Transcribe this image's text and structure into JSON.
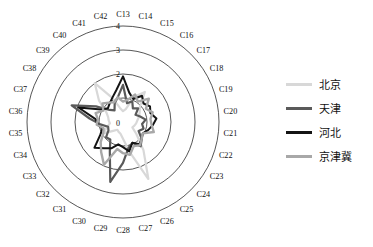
{
  "chart_data": {
    "type": "line",
    "variant": "radar",
    "title": "",
    "xlabel": "",
    "ylabel": "",
    "rlim": [
      0,
      4
    ],
    "r_ticks": [
      0,
      1,
      2,
      3,
      4
    ],
    "r_tick_labels": [
      "0",
      "1",
      "2",
      "3",
      "4"
    ],
    "r_tick_labels_shown": [
      "0",
      "2",
      "3",
      "4"
    ],
    "grid": true,
    "grid_shape": "circular",
    "legend_position": "right",
    "start_angle_deg": 90,
    "direction": "clockwise",
    "categories": [
      "C13",
      "C14",
      "C15",
      "C16",
      "C17",
      "C18",
      "C19",
      "C20",
      "C21",
      "C22",
      "C23",
      "C24",
      "C25",
      "C26",
      "C27",
      "C28",
      "C29",
      "C30",
      "C31",
      "C32",
      "C33",
      "C34",
      "C35",
      "C36",
      "C37",
      "C38",
      "C39",
      "C40",
      "C41",
      "C42"
    ],
    "series": [
      {
        "name": "北京",
        "color": "#d8d8d8",
        "width": 2.2,
        "values": [
          0.45,
          0.55,
          1.15,
          1.55,
          0.95,
          0.8,
          0.7,
          0.6,
          0.55,
          0.5,
          0.45,
          0.75,
          1.45,
          2.6,
          1.25,
          0.7,
          0.5,
          0.45,
          0.4,
          0.55,
          0.95,
          0.7,
          0.55,
          0.6,
          0.65,
          0.8,
          1.35,
          2.0,
          1.1,
          0.6
        ]
      },
      {
        "name": "天津",
        "color": "#5a5a5a",
        "width": 2.2,
        "values": [
          1.55,
          0.8,
          0.95,
          0.7,
          0.85,
          0.6,
          0.75,
          0.95,
          0.8,
          0.9,
          0.75,
          1.05,
          1.25,
          0.95,
          1.1,
          1.7,
          2.55,
          1.35,
          0.9,
          0.95,
          0.7,
          0.65,
          0.95,
          1.4,
          2.25,
          1.3,
          0.75,
          0.6,
          0.85,
          1.05
        ]
      },
      {
        "name": "河北",
        "color": "#141414",
        "width": 2.0,
        "values": [
          1.9,
          1.25,
          1.05,
          1.35,
          1.15,
          1.3,
          1.2,
          1.4,
          1.25,
          1.1,
          0.95,
          1.05,
          1.15,
          0.95,
          1.25,
          1.05,
          0.95,
          1.2,
          1.35,
          1.6,
          1.1,
          0.9,
          1.05,
          1.15,
          1.95,
          1.05,
          0.85,
          0.95,
          1.1,
          1.35
        ]
      },
      {
        "name": "京津冀",
        "color": "#a8a8a8",
        "width": 2.4,
        "values": [
          0.85,
          0.95,
          1.25,
          1.05,
          1.45,
          1.1,
          1.3,
          1.15,
          1.2,
          1.35,
          0.95,
          1.05,
          1.2,
          1.1,
          1.4,
          1.3,
          1.15,
          1.95,
          1.55,
          1.25,
          0.95,
          0.85,
          1.1,
          1.05,
          1.2,
          0.95,
          1.15,
          1.0,
          0.9,
          1.05
        ]
      }
    ]
  },
  "legend": {
    "items": [
      {
        "label": "北京",
        "color": "#d8d8d8"
      },
      {
        "label": "天津",
        "color": "#5a5a5a"
      },
      {
        "label": "河北",
        "color": "#141414"
      },
      {
        "label": "京津冀",
        "color": "#a8a8a8"
      }
    ]
  },
  "geometry": {
    "cx": 123,
    "cy": 122,
    "r_max_px": 96,
    "ring_count": 4
  }
}
